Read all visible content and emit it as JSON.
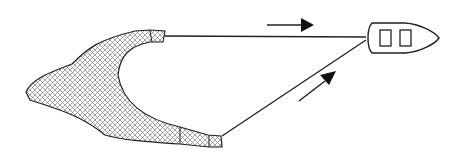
{
  "diagram": {
    "colors": {
      "stroke": "#222222",
      "background": "#ffffff",
      "hatch": "#555555"
    },
    "elements": {
      "net": "hatched net shape",
      "upper_tow_line": "line from upper net wing to boat",
      "lower_tow_line": "line from lower net wing to boat",
      "upper_arrow": "rightward arrow",
      "lower_arrow": "diagonal up-right arrow",
      "boat": "boat with two cabin windows"
    }
  }
}
